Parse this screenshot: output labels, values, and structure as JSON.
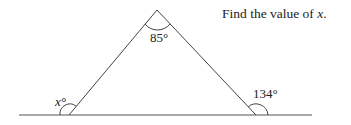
{
  "prompt": {
    "text": "Find the value of ",
    "variable": "x",
    "end": "."
  },
  "diagram": {
    "type": "triangle-exterior-angle",
    "angles": {
      "apex": "85°",
      "left_exterior": "x°",
      "right_exterior": "134°"
    },
    "colors": {
      "line": "#444444",
      "text": "#222222"
    }
  }
}
